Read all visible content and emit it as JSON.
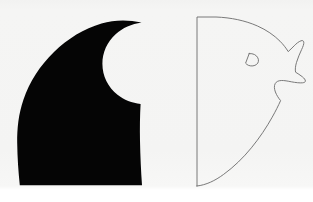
{
  "figure": {
    "caption": "",
    "background_color": "#f4f4f3",
    "page_color": "#ffffff",
    "panel": {
      "x": 0,
      "y": 0,
      "width": 313,
      "height": 190
    },
    "shapes": [
      {
        "id": "negative-silhouette",
        "name": "black-silhouette",
        "label": "Solid black negative-space silhouette",
        "fill_color": "#050505",
        "stroke_color": "none",
        "stroke_width": 0,
        "filled": true,
        "bbox": {
          "x": 17,
          "y": 20,
          "width": 126,
          "height": 166
        },
        "path": "M 141.5 22.5 C 128.0 19.6 114.0 19.8 101.5 23.5 C 84.0 28.6 68.0 38.5 54.0 52.0 C 40.0 65.5 29.5 82.0 23.5 99.5 C 18.5 114.0 17.0 128.5 17.2 143.0 C 17.4 157.5 18.4 171.5 19.8 185.2 L 142.0 185.2 C 141.0 171.0 140.3 156.0 140.0 141.0 C 139.8 128.0 139.9 115.5 140.6 104.0 C 132.0 103.0 124.0 100.0 117.5 94.8 C 108.0 87.2 102.4 76.0 102.4 63.8 C 102.4 52.4 107.2 41.8 115.6 34.2 C 122.6 27.9 131.7 24.0 141.5 22.5 Z",
        "notch": {
          "id": "silhouette-bite",
          "name": "circular-white-notch",
          "label": "Circular white bite in the silhouette",
          "cx": 128,
          "cy": 63,
          "r": 40
        }
      },
      {
        "id": "positive-outline",
        "name": "eagle-head-outline",
        "label": "Line outline of an eagle head facing right",
        "fill_color": "none",
        "stroke_color": "#6b6b6b",
        "stroke_width": 0.9,
        "filled": false,
        "bbox": {
          "x": 196,
          "y": 16,
          "width": 110,
          "height": 171
        },
        "path": "M 197.0 186.0 L 197.0 17.0 L 216.0 17.0 C 231.0 17.6 245.0 20.5 257.5 26.0 C 266.5 30.0 274.0 35.2 280.0 41.2 C 283.3 44.5 286.0 48.0 288.2 51.6 C 290.0 50.0 292.0 48.0 294.2 45.8 C 296.3 43.6 298.7 41.6 301.0 40.8 C 302.6 40.2 303.6 40.8 303.8 42.2 C 304.0 44.0 303.0 46.6 301.6 49.6 C 299.8 53.5 297.8 58.0 296.5 62.4 C 295.4 66.2 295.0 69.6 295.6 72.2 C 297.6 73.5 300.2 75.0 302.4 76.8 C 304.2 78.3 305.4 79.8 305.4 81.0 C 305.4 82.0 304.4 82.6 302.6 82.8 C 299.8 83.1 295.6 82.6 291.4 81.8 C 287.8 81.1 284.2 80.4 281.4 80.5 C 278.4 80.6 276.3 81.6 275.2 83.6 C 274.0 85.8 274.2 88.8 275.4 92.0 C 276.6 95.2 278.7 98.4 280.6 100.6 C 278.4 105.5 275.6 111.2 272.2 117.2 C 266.6 127.2 259.6 137.8 251.4 147.8 C 243.2 157.8 233.8 167.0 223.6 174.4 C 215.0 180.7 206.2 185.0 197.0 186.0 Z",
        "eye": {
          "id": "eagle-eye",
          "name": "eye-shape",
          "label": "Teardrop eye outline",
          "stroke_color": "#6b6b6b",
          "stroke_width": 0.9,
          "path": "M 249.2 53.6 C 253.2 53.2 256.4 55.0 257.8 57.8 C 259.0 60.2 258.6 62.8 256.6 64.4 C 254.6 66.0 251.4 66.4 248.6 65.4 C 247.4 64.9 246.4 64.2 245.6 63.2 L 249.2 53.6 Z"
        }
      }
    ]
  }
}
